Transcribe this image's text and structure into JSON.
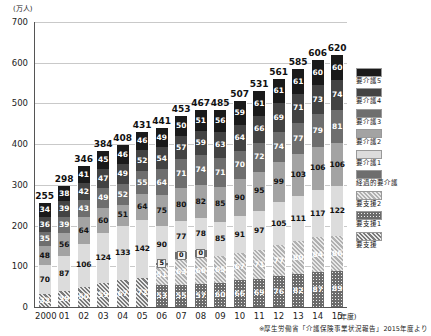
{
  "axis": {
    "y_unit": "(万人)",
    "y_ticks": [
      "700",
      "600",
      "500",
      "400",
      "300",
      "200",
      "100",
      "0"
    ],
    "x_unit": "(年度)",
    "x_labels": [
      "2000",
      "01",
      "02",
      "03",
      "04",
      "05",
      "06",
      "07",
      "08",
      "09",
      "10",
      "11",
      "12",
      "13",
      "14",
      "15"
    ]
  },
  "source": "※厚生労働省「介護保険事業状況報告」2015年度より",
  "legend": [
    {
      "label": "要介護5",
      "color": "#1a1a1a",
      "pattern": "solid"
    },
    {
      "label": "要介護4",
      "color": "#434343",
      "pattern": "solid"
    },
    {
      "label": "要介護3",
      "color": "#6e6e6e",
      "pattern": "solid"
    },
    {
      "label": "要介護2",
      "color": "#a3a3a3",
      "pattern": "solid"
    },
    {
      "label": "要介護1",
      "color": "#dcdcdc",
      "pattern": "solid"
    },
    {
      "label": "経過的要介護",
      "color": "#6e6e6e",
      "pattern": "solid"
    },
    {
      "label": "要支援2",
      "color": "#b0b0b0",
      "pattern": "diagonal"
    },
    {
      "label": "要支援1",
      "color": "#6b6b6b",
      "pattern": "dots"
    },
    {
      "label": "要支援",
      "color": "#7a7a7a",
      "pattern": "diagonal"
    }
  ],
  "chart_data": {
    "type": "bar",
    "title": "",
    "xlabel": "(年度)",
    "ylabel": "(万人)",
    "ylim": [
      0,
      700
    ],
    "grid": true,
    "stacked": true,
    "legend_position": "right",
    "categories": [
      "2000",
      "01",
      "02",
      "03",
      "04",
      "05",
      "06",
      "07",
      "08",
      "09",
      "10",
      "11",
      "12",
      "13",
      "14",
      "15"
    ],
    "totals": [
      255,
      298,
      346,
      384,
      408,
      431,
      441,
      453,
      467,
      485,
      507,
      531,
      561,
      585,
      606,
      620
    ],
    "series": [
      {
        "name": "要支援",
        "values": [
          32,
          39,
          50,
          59,
          67,
          72,
          null,
          null,
          null,
          null,
          null,
          null,
          null,
          null,
          null,
          null
        ]
      },
      {
        "name": "要支援1",
        "values": [
          null,
          null,
          null,
          null,
          null,
          null,
          53,
          55,
          57,
          60,
          66,
          69,
          76,
          82,
          87,
          89
        ]
      },
      {
        "name": "要支援2",
        "values": [
          null,
          null,
          null,
          null,
          null,
          null,
          51,
          63,
          66,
          65,
          67,
          71,
          77,
          80,
          84,
          86
        ]
      },
      {
        "name": "経過的要介護",
        "values": [
          null,
          null,
          null,
          null,
          null,
          null,
          5,
          0,
          0,
          null,
          null,
          null,
          null,
          null,
          null,
          null
        ]
      },
      {
        "name": "要介護1",
        "values": [
          70,
          87,
          106,
          124,
          133,
          142,
          90,
          77,
          78,
          85,
          91,
          97,
          105,
          111,
          117,
          122
        ]
      },
      {
        "name": "要介護2",
        "values": [
          48,
          56,
          64,
          60,
          51,
          64,
          75,
          80,
          82,
          85,
          90,
          95,
          99,
          103,
          106,
          106
        ]
      },
      {
        "name": "要介護3",
        "values": [
          35,
          39,
          43,
          49,
          52,
          55,
          64,
          71,
          74,
          71,
          70,
          72,
          74,
          77,
          79,
          81
        ]
      },
      {
        "name": "要介護4",
        "values": [
          36,
          39,
          42,
          47,
          49,
          52,
          54,
          57,
          59,
          63,
          64,
          66,
          69,
          71,
          73,
          74
        ]
      },
      {
        "name": "要介護5",
        "values": [
          34,
          38,
          41,
          45,
          46,
          46,
          49,
          50,
          51,
          56,
          59,
          61,
          61,
          61,
          60,
          60
        ]
      }
    ]
  }
}
